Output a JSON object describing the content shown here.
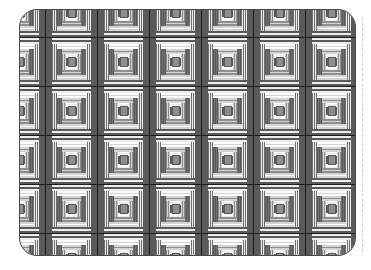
{
  "image": {
    "title": "Grayscale log-cabin quilt pattern panel",
    "width": 371,
    "height": 270,
    "background_color": "#ffffff"
  },
  "panel": {
    "name": "quilt-panel",
    "x": 19,
    "y": 9,
    "width": 337,
    "height": 247,
    "corner_radius": 18,
    "border_color": "#4a4a4a",
    "border_width": 1
  },
  "guide": {
    "name": "dashed-guide-rule",
    "x": 362,
    "y_top": 18,
    "y_bottom": 252,
    "style": "dashed",
    "color": "#c9c9c9"
  },
  "palette": {
    "grid_line": "#1d1d1d",
    "dark": "#5a5a5a",
    "mid_dark": "#707070",
    "mid": "#8e8e8e",
    "mid_light": "#a8a8a8",
    "light": "#d4d4d4",
    "near_white": "#ededed",
    "white": "#fbfbfb"
  },
  "grid": {
    "columns": 8,
    "rows": 6,
    "block_width": 52,
    "block_height": 49,
    "offset_x": -26,
    "offset_y": -21,
    "visible_columns": 6.5,
    "visible_rows": 5
  },
  "block": {
    "name": "log-cabin-block",
    "description": "Concentric nested rectangles alternating dark gray and light stripes around a small central square.",
    "rings": [
      {
        "index": 0,
        "inset": 0,
        "side_fill": "#5a5a5a",
        "band_fill": "#5a5a5a",
        "stripes": 4,
        "stripe_light": "#ededed",
        "stripe_dark": "#5a5a5a"
      },
      {
        "index": 1,
        "inset": 6,
        "side_fill": "#ededed",
        "band_fill": "#d4d4d4",
        "stripes": 3,
        "stripe_light": "#fbfbfb",
        "stripe_dark": "#707070"
      },
      {
        "index": 2,
        "inset": 11,
        "side_fill": "#707070",
        "band_fill": "#8e8e8e",
        "stripes": 3,
        "stripe_light": "#d4d4d4",
        "stripe_dark": "#5a5a5a"
      },
      {
        "index": 3,
        "inset": 16,
        "side_fill": "#d4d4d4",
        "band_fill": "#ededed",
        "stripes": 2,
        "stripe_light": "#fbfbfb",
        "stripe_dark": "#8e8e8e"
      },
      {
        "index": 4,
        "inset": 20,
        "side_fill": "#5a5a5a",
        "band_fill": "#707070",
        "stripes": 2,
        "stripe_light": "#a8a8a8",
        "stripe_dark": "#5a5a5a"
      }
    ],
    "core": {
      "fill": "#8e8e8e",
      "border": "#5a5a5a",
      "width": 8,
      "height": 10
    }
  }
}
